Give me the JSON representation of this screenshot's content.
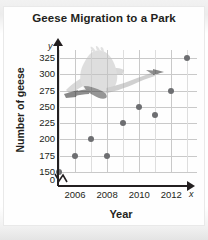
{
  "chart_data": {
    "type": "scatter",
    "title": "Geese Migration to a Park",
    "xlabel": "Year",
    "ylabel": "Number of geese",
    "x_axis_symbol": "x",
    "y_axis_symbol": "y",
    "grid": true,
    "legend": null,
    "axis_break": true,
    "xlim": [
      2005,
      2013.6
    ],
    "ylim": [
      150,
      337.5
    ],
    "x": [
      2005,
      2006,
      2007,
      2008,
      2009,
      2010,
      2011,
      2012,
      2013
    ],
    "values": [
      150,
      175,
      200,
      175,
      225,
      250,
      237,
      275,
      325
    ],
    "x_tick_labels": [
      "2006",
      "2008",
      "2010",
      "2012"
    ],
    "x_tick_values": [
      2006,
      2008,
      2010,
      2012
    ],
    "x_gridline_values": [
      2005,
      2006,
      2007,
      2008,
      2009,
      2010,
      2011,
      2012,
      2013
    ],
    "y_tick_labels": [
      "0",
      "150",
      "175",
      "200",
      "225",
      "250",
      "275",
      "300",
      "325"
    ],
    "y_tick_values": [
      0,
      150,
      175,
      200,
      225,
      250,
      275,
      300,
      325
    ],
    "y_gridline_values": [
      150,
      175,
      200,
      225,
      250,
      275,
      300,
      325
    ],
    "point_color": "#6d6e71",
    "grid_color": "#c9c9c9",
    "axis_color": "#231f20",
    "background": "#ffffff",
    "watermark": "flying-goose-image",
    "points": [
      {
        "x": 2005,
        "y": 150
      },
      {
        "x": 2006,
        "y": 175
      },
      {
        "x": 2007,
        "y": 200
      },
      {
        "x": 2008,
        "y": 175
      },
      {
        "x": 2009,
        "y": 225
      },
      {
        "x": 2010,
        "y": 250
      },
      {
        "x": 2011,
        "y": 237
      },
      {
        "x": 2012,
        "y": 275
      },
      {
        "x": 2013,
        "y": 325
      }
    ]
  }
}
